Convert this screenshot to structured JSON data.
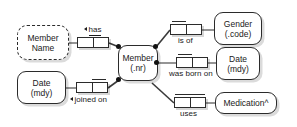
{
  "diagram": {
    "background_color": "#ffffff",
    "line_color": "#6f6f6f",
    "stroke_color": "#2b2b2b",
    "central_entity": {
      "line1": "Member",
      "line2": "(.nr)"
    },
    "objects": [
      {
        "id": "member-name",
        "line1": "Member",
        "line2": "Name",
        "style": "dashed"
      },
      {
        "id": "date-joined",
        "line1": "Date",
        "line2": "(mdy)",
        "style": "solid"
      },
      {
        "id": "gender",
        "line1": "Gender",
        "line2": "(.code)",
        "style": "solid"
      },
      {
        "id": "date-born",
        "line1": "Date",
        "line2": "(mdy)",
        "style": "solid"
      },
      {
        "id": "medication",
        "line1": "Medication^",
        "line2": "",
        "style": "solid"
      }
    ],
    "predicates": [
      {
        "id": "has",
        "label": "has",
        "arrow": true,
        "underline": true,
        "label_position": "above",
        "uniqueness": "left"
      },
      {
        "id": "joined-on",
        "label": "joined on",
        "arrow": true,
        "underline": false,
        "label_position": "below",
        "uniqueness": "right"
      },
      {
        "id": "is-of",
        "label": "is of",
        "arrow": false,
        "underline": false,
        "label_position": "below",
        "uniqueness": "left"
      },
      {
        "id": "was-born-on",
        "label": "was born on",
        "arrow": false,
        "underline": false,
        "label_position": "below",
        "uniqueness": "left"
      },
      {
        "id": "uses",
        "label": "uses",
        "arrow": false,
        "underline": false,
        "label_position": "below",
        "uniqueness": "both"
      }
    ]
  }
}
